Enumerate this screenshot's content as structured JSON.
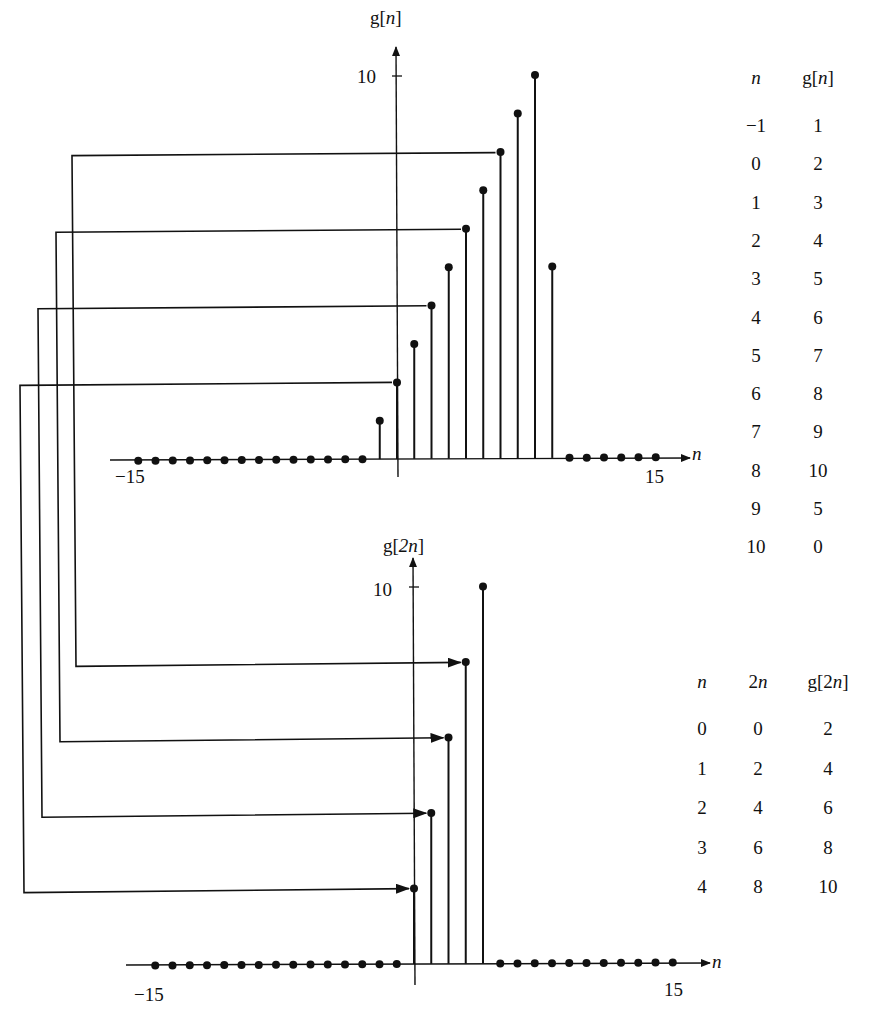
{
  "chart_data": [
    {
      "type": "stem",
      "title": "g[n]",
      "ylabel": "g[n]",
      "xlabel": "n",
      "x_tick_labels": [
        "-15",
        "15"
      ],
      "y_tick_labels": [
        "10"
      ],
      "xlim": [
        -15,
        15
      ],
      "ylim": [
        0,
        10
      ],
      "x": [
        -15,
        -14,
        -13,
        -12,
        -11,
        -10,
        -9,
        -8,
        -7,
        -6,
        -5,
        -4,
        -3,
        -2,
        -1,
        0,
        1,
        2,
        3,
        4,
        5,
        6,
        7,
        8,
        9,
        10,
        11,
        12,
        13,
        14,
        15
      ],
      "values": [
        0,
        0,
        0,
        0,
        0,
        0,
        0,
        0,
        0,
        0,
        0,
        0,
        0,
        0,
        1,
        2,
        3,
        4,
        5,
        6,
        7,
        8,
        9,
        10,
        5,
        0,
        0,
        0,
        0,
        0,
        0
      ]
    },
    {
      "type": "stem",
      "title": "g[2n]",
      "ylabel": "g[2n]",
      "xlabel": "n",
      "x_tick_labels": [
        "-15",
        "15"
      ],
      "y_tick_labels": [
        "10"
      ],
      "xlim": [
        -15,
        15
      ],
      "ylim": [
        0,
        10
      ],
      "x": [
        -15,
        -14,
        -13,
        -12,
        -11,
        -10,
        -9,
        -8,
        -7,
        -6,
        -5,
        -4,
        -3,
        -2,
        -1,
        0,
        1,
        2,
        3,
        4,
        5,
        6,
        7,
        8,
        9,
        10,
        11,
        12,
        13,
        14,
        15
      ],
      "values": [
        0,
        0,
        0,
        0,
        0,
        0,
        0,
        0,
        0,
        0,
        0,
        0,
        0,
        0,
        0,
        2,
        4,
        6,
        8,
        10,
        0,
        0,
        0,
        0,
        0,
        0,
        0,
        0,
        0,
        0,
        0
      ],
      "annotations": "Arrows map g[0], g[2], g[4], g[6] in top plot to g[2n] at n=0,1,2,3"
    }
  ],
  "top_plot": {
    "ylabel": "g[n]",
    "ylabel_arg": "n",
    "ytick": "10",
    "xmin_label": "−15",
    "xmax_label": "15",
    "xaxis_label": "n"
  },
  "bottom_plot": {
    "ylabel": "g[2n]",
    "ylabel_arg": "2n",
    "ytick": "10",
    "xmin_label": "−15",
    "xmax_label": "15",
    "xaxis_label": "n"
  },
  "table_top": {
    "headers": [
      "n",
      "g[n]"
    ],
    "rows": [
      [
        "−1",
        "1"
      ],
      [
        "0",
        "2"
      ],
      [
        "1",
        "3"
      ],
      [
        "2",
        "4"
      ],
      [
        "3",
        "5"
      ],
      [
        "4",
        "6"
      ],
      [
        "5",
        "7"
      ],
      [
        "6",
        "8"
      ],
      [
        "7",
        "9"
      ],
      [
        "8",
        "10"
      ],
      [
        "9",
        "5"
      ],
      [
        "10",
        "0"
      ]
    ]
  },
  "table_bottom": {
    "headers": [
      "n",
      "2n",
      "g[2n]"
    ],
    "rows": [
      [
        "0",
        "0",
        "2"
      ],
      [
        "1",
        "2",
        "4"
      ],
      [
        "2",
        "4",
        "6"
      ],
      [
        "3",
        "6",
        "8"
      ],
      [
        "4",
        "8",
        "10"
      ]
    ]
  }
}
